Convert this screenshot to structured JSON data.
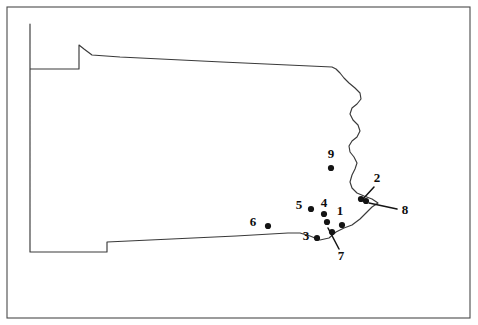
{
  "figure": {
    "region_name": "Pennsylvania",
    "frame": {
      "x": 7,
      "y": 7,
      "width": 463,
      "height": 311
    },
    "colors": {
      "background": "#ffffff",
      "frame_stroke": "#4a4a4a",
      "outline_stroke": "#3a3a3a",
      "dot_fill": "#141414",
      "label_fill": "#0d0d0d"
    }
  },
  "chart_data": {
    "type": "scatter",
    "xlabel": "",
    "ylabel": "",
    "grid": false,
    "legend": "none",
    "xlim": [
      7,
      470
    ],
    "ylim": [
      7,
      318
    ],
    "outline_path": "M 30,24 L 30,166 L 30,252 L 107,252 L 107,242 L 236,236 L 288,233 L 300,233 L 310,236 L 320,240 L 329,238 L 336,232 L 344,228 L 352,225 L 360,219 L 366,213 L 372,207 L 378,203 L 372,199 L 364,196 L 357,193 L 352,188 L 350,182 L 352,175 L 355,169 L 357,163 L 354,157 L 350,152 L 349,146 L 352,141 L 357,137 L 360,131 L 358,125 L 353,120 L 350,114 L 352,108 L 357,104 L 361,99 L 360,93 L 355,88 L 349,83 L 344,78 L 340,73 L 336,69 L 332,67 L 222,62 L 120,57 L 92,55 L 84,49 L 79,45 L 79,69 L 73,69 L 30,69 L 30,24 Z",
    "sites": [
      {
        "id": "1",
        "label": "1",
        "label_x": 340,
        "label_y": 212,
        "dot_x": 342,
        "dot_y": 225,
        "leader": false
      },
      {
        "id": "2",
        "label": "2",
        "label_x": 377,
        "label_y": 179,
        "dot_x": 361,
        "dot_y": 199,
        "leader": true,
        "leader_x1": 374,
        "leader_y1": 187,
        "leader_x2": 363,
        "leader_y2": 199
      },
      {
        "id": "3",
        "label": "3",
        "label_x": 306,
        "label_y": 237,
        "dot_x": 317,
        "dot_y": 238,
        "leader": false
      },
      {
        "id": "4",
        "label": "4",
        "label_x": 324,
        "label_y": 204,
        "dot_x": 324,
        "dot_y": 214,
        "leader": false
      },
      {
        "id": "4b",
        "label": "",
        "label_x": 0,
        "label_y": 0,
        "dot_x": 327,
        "dot_y": 222,
        "leader": false
      },
      {
        "id": "5",
        "label": "5",
        "label_x": 299,
        "label_y": 206,
        "dot_x": 311,
        "dot_y": 209,
        "leader": false
      },
      {
        "id": "6",
        "label": "6",
        "label_x": 253,
        "label_y": 223,
        "dot_x": 268,
        "dot_y": 226,
        "leader": false
      },
      {
        "id": "7",
        "label": "7",
        "label_x": 341,
        "label_y": 257,
        "dot_x": 332,
        "dot_y": 232,
        "leader": true,
        "leader_x1": 339,
        "leader_y1": 249,
        "leader_x2": 328,
        "leader_y2": 228
      },
      {
        "id": "8",
        "label": "8",
        "label_x": 405,
        "label_y": 211,
        "dot_x": 366,
        "dot_y": 201,
        "leader": true,
        "leader_x1": 397,
        "leader_y1": 209,
        "leader_x2": 369,
        "leader_y2": 203
      },
      {
        "id": "9",
        "label": "9",
        "label_x": 331,
        "label_y": 155,
        "dot_x": 331,
        "dot_y": 168,
        "leader": false
      }
    ],
    "site_count": 9,
    "dot_radius": 3.1
  }
}
